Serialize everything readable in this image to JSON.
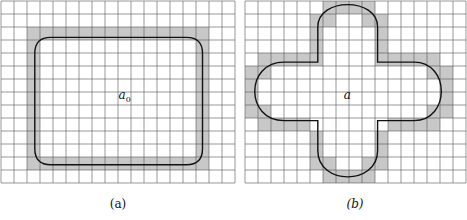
{
  "figure": {
    "panels": [
      {
        "id": "a",
        "caption": "(a)",
        "center_label": "a",
        "center_sub": "0",
        "grid": {
          "cols": 18,
          "rows": 14,
          "cell": 13,
          "x": 1,
          "y": 1
        },
        "shape": "rounded-rectangle",
        "shaded_color": "#c8c8c8"
      },
      {
        "id": "b",
        "caption": "(b)",
        "center_label": "a",
        "center_sub": "",
        "grid": {
          "cols": 17,
          "rows": 14,
          "cell": 13,
          "x": 245,
          "y": 1
        },
        "shape": "cross-with-rounded-corners",
        "shaded_color": "#c8c8c8"
      }
    ],
    "colors": {
      "grid": "#555555",
      "shade": "#c8c8c8",
      "curve": "#111111"
    }
  }
}
